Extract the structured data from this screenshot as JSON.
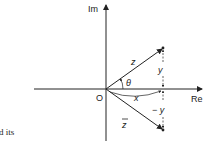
{
  "diagram": {
    "axes": {
      "imaginary_label": "Im",
      "real_label": "Re",
      "origin_label": "O"
    },
    "vectors": [
      {
        "name": "z",
        "label": "z",
        "direction": "upper-right"
      },
      {
        "name": "z-conjugate",
        "label": "z",
        "overbar": true,
        "direction": "lower-right"
      }
    ],
    "angle_label": "θ",
    "real_part_label": "x",
    "imag_part_label": "y",
    "neg_imag_part_label": "− y"
  },
  "text_fragment": "d its",
  "colors": {
    "ink": "#222222",
    "background": "#ffffff"
  }
}
